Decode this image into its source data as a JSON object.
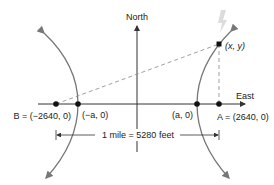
{
  "diagram": {
    "axes": {
      "north_label": "North",
      "east_label": "East"
    },
    "points": {
      "B": {
        "label": "B = (−2640, 0)",
        "x": -2640,
        "y": 0
      },
      "neg_a": {
        "label": "(−a, 0)"
      },
      "a": {
        "label": "(a, 0)"
      },
      "A": {
        "label": "A = (2640, 0)",
        "x": 2640,
        "y": 0
      },
      "P": {
        "label": "(x, y)"
      }
    },
    "dimension": {
      "label": "1 mile = 5280 feet"
    },
    "colors": {
      "axis": "#333333",
      "hyperbola": "#777777",
      "dashed": "#888888",
      "lightning": "#d8d8d8",
      "point": "#111111"
    }
  }
}
